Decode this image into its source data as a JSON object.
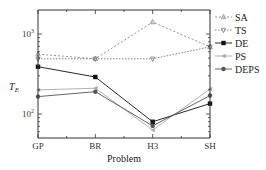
{
  "chart_data": {
    "type": "line",
    "title": "",
    "xlabel": "Problem",
    "ylabel": "T_E",
    "yscale": "log",
    "ylim": [
      40,
      2500
    ],
    "categories": [
      "GP",
      "BR",
      "H3",
      "SH"
    ],
    "yticks": [
      {
        "value": 100,
        "label": "10",
        "exp": "2"
      },
      {
        "value": 1000,
        "label": "10",
        "exp": "3"
      }
    ],
    "grid": false,
    "legend_position": "right-top",
    "series": [
      {
        "name": "SA",
        "marker": "triangle-up",
        "dash": "2,2",
        "color": "#888888",
        "values": [
          560,
          490,
          1410,
          690
        ]
      },
      {
        "name": "TS",
        "marker": "triangle-down",
        "dash": "1.5,1.5",
        "color": "#777777",
        "values": [
          490,
          490,
          490,
          690
        ]
      },
      {
        "name": "DE",
        "marker": "square",
        "dash": "",
        "color": "#111111",
        "values": [
          390,
          290,
          80,
          135
        ]
      },
      {
        "name": "PS",
        "marker": "triangle-left",
        "dash": "",
        "color": "#aaaaaa",
        "values": [
          200,
          210,
          63,
          205
        ]
      },
      {
        "name": "DEPS",
        "marker": "circle",
        "dash": "",
        "color": "#555555",
        "values": [
          165,
          190,
          71,
          170
        ]
      }
    ]
  }
}
